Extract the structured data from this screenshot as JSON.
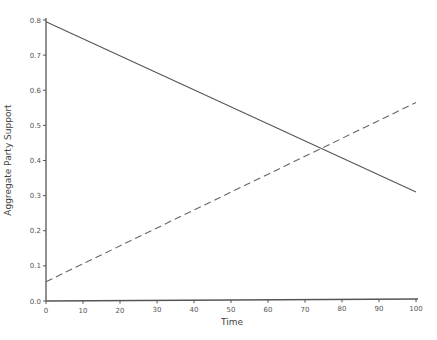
{
  "chart_data": {
    "type": "line",
    "title": "",
    "xlabel": "Time",
    "ylabel": "Aggregate Party Support",
    "xlim": [
      0,
      100
    ],
    "ylim": [
      0,
      0.8
    ],
    "xticks": [
      "0",
      "10",
      "20",
      "30",
      "40",
      "50",
      "60",
      "70",
      "80",
      "90",
      "100"
    ],
    "yticks": [
      "0.0",
      "0.1",
      "0.2",
      "0.3",
      "0.4",
      "0.5",
      "0.6",
      "0.7",
      "0.8"
    ],
    "grid": false,
    "legend": null,
    "series": [
      {
        "name": "solid",
        "style": "solid",
        "x": [
          0,
          100
        ],
        "values": [
          0.795,
          0.31
        ]
      },
      {
        "name": "dashed",
        "style": "dashed",
        "x": [
          0,
          100
        ],
        "values": [
          0.055,
          0.565
        ]
      }
    ],
    "annotations": [],
    "intersection": {
      "x": 74.4,
      "y": 0.433
    }
  },
  "colors": {
    "axis": "#555555",
    "solid_line": "#555555",
    "dashed_line": "#666666"
  }
}
